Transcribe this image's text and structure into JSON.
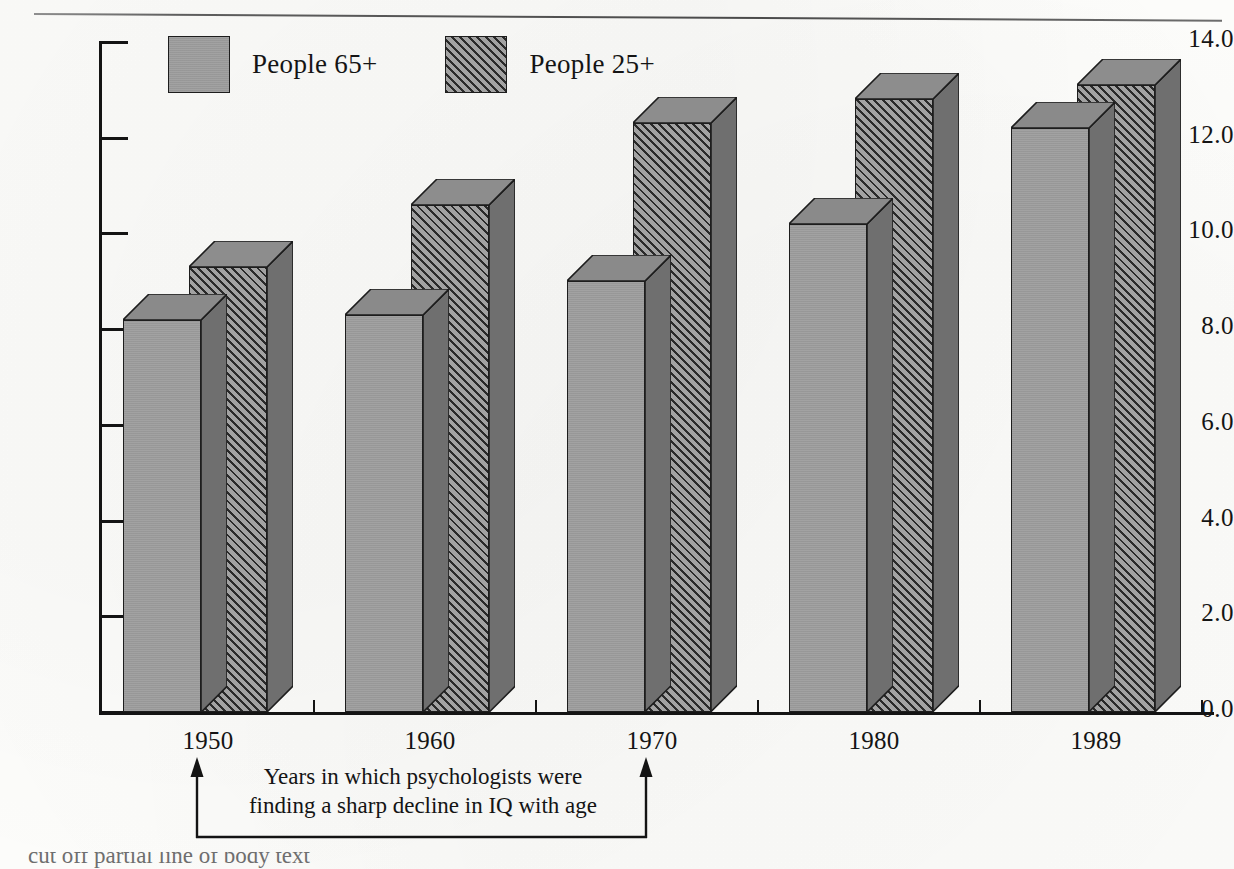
{
  "chart_data": {
    "type": "bar",
    "title": "",
    "xlabel": "",
    "ylabel": "",
    "categories": [
      "1950",
      "1960",
      "1970",
      "1980",
      "1989"
    ],
    "series": [
      {
        "name": "People 65+",
        "values": [
          8.2,
          8.3,
          9.0,
          10.2,
          12.2
        ],
        "fill": "solid-gray",
        "color": "#9d9d9d"
      },
      {
        "name": "People 25+",
        "values": [
          9.3,
          10.6,
          12.3,
          12.8,
          13.1
        ],
        "fill": "diagonal-hatch",
        "color": "#a2a2a2"
      }
    ],
    "ylim": [
      0.0,
      14.0
    ],
    "ytick_values": [
      0.0,
      2.0,
      4.0,
      6.0,
      8.0,
      10.0,
      12.0,
      14.0
    ],
    "ytick_labels": [
      "0.0",
      "2.0",
      "4.0",
      "6.0",
      "8.0",
      "10.0",
      "12.0",
      "14.0"
    ],
    "grid": false,
    "legend_position": "top-left-inside",
    "style": "3d-bars",
    "annotations": [
      {
        "text": "Years in which psychologists were finding a sharp decline in IQ with age",
        "line1": "Years in which psychologists were",
        "line2": "finding a sharp decline in IQ with age",
        "type": "bracket-with-arrows",
        "spans": [
          "1950",
          "1970"
        ]
      }
    ]
  },
  "legend": {
    "items": [
      {
        "label": "People 65+",
        "swatch": "solid-gray-swatch"
      },
      {
        "label": "People 25+",
        "swatch": "hatched-swatch"
      }
    ]
  },
  "caption": {
    "text": "cut off partial line of body text"
  }
}
